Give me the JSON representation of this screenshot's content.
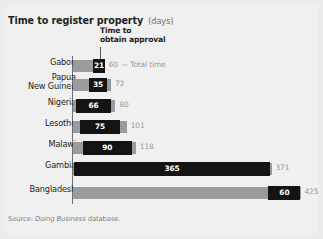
{
  "title": {
    "main": "Time to register property",
    "unit": "(days)"
  },
  "legend": {
    "line1": "Time to",
    "line2": "obtain approval",
    "total_annotation": "— Total time"
  },
  "source": {
    "prefix": "Source:",
    "italic": "Doing Business",
    "suffix": "database."
  },
  "colors": {
    "background": "#ececec",
    "panel": "#f0f0f0",
    "total_bar": "#9a9b9d",
    "approval_bar": "#141414",
    "approval_text": "#ffffff",
    "total_text": "#98999b",
    "axis": "#6e6f71",
    "title_text": "#231f20",
    "unit_text": "#6d6e70",
    "source_text": "#808284"
  },
  "chart_data": {
    "type": "bar",
    "orientation": "horizontal",
    "title": "Time to register property (days)",
    "xlabel": "days",
    "ylabel": "",
    "xlim": [
      0,
      425
    ],
    "grid": false,
    "legend_position": "top-inside",
    "categories": [
      "Gabon",
      "Papua New Guinea",
      "Nigeria",
      "Lesotho",
      "Malawi",
      "Gambia",
      "Bangladesh"
    ],
    "series": [
      {
        "name": "Time to obtain approval",
        "values": [
          21,
          35,
          66,
          75,
          90,
          365,
          60
        ]
      },
      {
        "name": "Total time",
        "values": [
          60,
          72,
          80,
          101,
          118,
          371,
          425
        ]
      }
    ],
    "rows": [
      {
        "label": "Gabon",
        "label_lines": [
          "Gabon"
        ],
        "approval": 21,
        "approval_text": "21",
        "total": 60,
        "total_text": "60",
        "approval_start": 39,
        "annotation": "— Total time"
      },
      {
        "label": "Papua New Guinea",
        "label_lines": [
          "Papua",
          "New Guinea"
        ],
        "approval": 35,
        "approval_text": "35",
        "total": 72,
        "total_text": "72",
        "approval_start": 30,
        "annotation": ""
      },
      {
        "label": "Nigeria",
        "label_lines": [
          "Nigeria"
        ],
        "approval": 66,
        "approval_text": "66",
        "total": 80,
        "total_text": "80",
        "approval_start": 6,
        "annotation": ""
      },
      {
        "label": "Lesotho",
        "label_lines": [
          "Lesotho"
        ],
        "approval": 75,
        "approval_text": "75",
        "total": 101,
        "total_text": "101",
        "approval_start": 14,
        "annotation": ""
      },
      {
        "label": "Malawi",
        "label_lines": [
          "Malawi"
        ],
        "approval": 90,
        "approval_text": "90",
        "total": 118,
        "total_text": "118",
        "approval_start": 20,
        "annotation": ""
      },
      {
        "label": "Gambia",
        "label_lines": [
          "Gambia"
        ],
        "approval": 365,
        "approval_text": "365",
        "total": 371,
        "total_text": "371",
        "approval_start": 3,
        "annotation": ""
      },
      {
        "label": "Bangladesh",
        "label_lines": [
          "Bangladesh"
        ],
        "approval": 60,
        "approval_text": "60",
        "total": 425,
        "total_text": "425",
        "approval_start": 365,
        "annotation": ""
      }
    ]
  },
  "layout": {
    "axis_x": 72.5,
    "plot_width": 228,
    "max_days": 425,
    "row_tops": [
      58,
      77,
      98,
      119,
      140,
      161,
      185
    ],
    "row_heights": [
      15,
      15,
      15,
      15,
      15,
      15,
      15
    ]
  }
}
